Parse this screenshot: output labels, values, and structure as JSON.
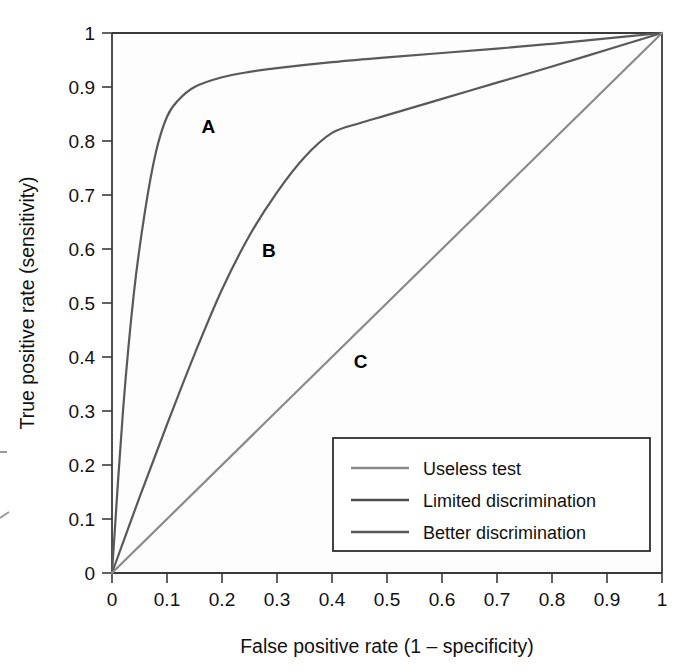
{
  "chart_data": {
    "type": "line",
    "title": "",
    "xlabel": "False positive rate (1 – specificity)",
    "ylabel": "True positive rate (sensitivity)",
    "xlim": [
      0,
      1
    ],
    "ylim": [
      0,
      1
    ],
    "grid": false,
    "legend_position": "lower-right",
    "xticks": [
      "0",
      "0.1",
      "0.2",
      "0.3",
      "0.4",
      "0.5",
      "0.6",
      "0.7",
      "0.8",
      "0.9",
      "1"
    ],
    "xtick_values": [
      0,
      0.1,
      0.2,
      0.3,
      0.4,
      0.5,
      0.6,
      0.7,
      0.8,
      0.9,
      1
    ],
    "yticks": [
      "0",
      "0.1",
      "0.2",
      "0.3",
      "0.4",
      "0.5",
      "0.6",
      "0.7",
      "0.8",
      "0.9",
      "1"
    ],
    "ytick_values": [
      0,
      0.1,
      0.2,
      0.3,
      0.4,
      0.5,
      0.6,
      0.7,
      0.8,
      0.9,
      1
    ],
    "series": [
      {
        "name": "Better discrimination",
        "curve_label": "A",
        "color": "#595959",
        "x": [
          0,
          0.02,
          0.04,
          0.06,
          0.08,
          0.1,
          0.12,
          0.15,
          0.2,
          0.25,
          0.3,
          0.4,
          0.5,
          0.6,
          0.7,
          0.8,
          0.9,
          1.0
        ],
        "y": [
          0,
          0.3,
          0.52,
          0.67,
          0.78,
          0.845,
          0.875,
          0.9,
          0.918,
          0.928,
          0.935,
          0.946,
          0.955,
          0.963,
          0.971,
          0.98,
          0.99,
          1.0
        ]
      },
      {
        "name": "Limited discrimination",
        "curve_label": "B",
        "color": "#595959",
        "x": [
          0,
          0.05,
          0.1,
          0.15,
          0.2,
          0.25,
          0.3,
          0.35,
          0.4,
          0.45,
          0.5,
          0.6,
          0.7,
          0.8,
          0.9,
          1.0
        ],
        "y": [
          0,
          0.14,
          0.275,
          0.405,
          0.525,
          0.625,
          0.705,
          0.77,
          0.815,
          0.833,
          0.848,
          0.878,
          0.908,
          0.938,
          0.969,
          1.0
        ]
      },
      {
        "name": "Useless test",
        "curve_label": "C",
        "color": "#8a8a8a",
        "x": [
          0,
          1
        ],
        "y": [
          0,
          1
        ]
      }
    ],
    "curve_annotations": [
      {
        "text": "A",
        "x": 0.175,
        "y": 0.828
      },
      {
        "text": "B",
        "x": 0.285,
        "y": 0.598
      },
      {
        "text": "C",
        "x": 0.452,
        "y": 0.393
      }
    ],
    "legend_entries": [
      {
        "label": "Useless test",
        "color": "#8a8a8a"
      },
      {
        "label": "Limited discrimination",
        "color": "#4d4d4d"
      },
      {
        "label": "Better discrimination",
        "color": "#595959"
      }
    ]
  }
}
